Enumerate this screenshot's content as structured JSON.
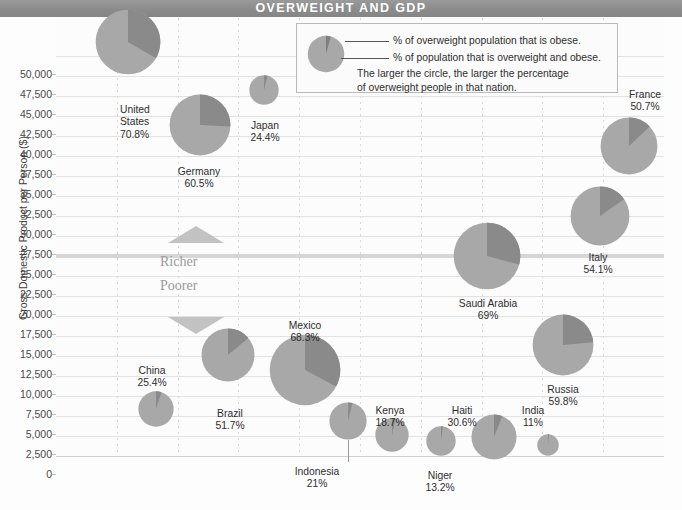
{
  "header": {
    "title": "OVERWEIGHT AND GDP"
  },
  "legend": {
    "line1": "% of overweight population that is obese.",
    "line2": "% of population that is overweight and obese.",
    "line3": "The larger the circle, the larger the percentage",
    "line4": "of overweight people in that nation."
  },
  "axis": {
    "y_title": "Gross Domestic Product per Person ($)",
    "y_ticks": [
      "50,000",
      "47,500",
      "45,000",
      "42,500",
      "40,000",
      "37,500",
      "35,000",
      "32,500",
      "30,000",
      "27,500",
      "25,000",
      "22,500",
      "20,000",
      "17,500",
      "15,000",
      "12,500",
      "10,000",
      "7,500",
      "5,000",
      "2,500",
      "0"
    ]
  },
  "annotations": {
    "richer": "Richer",
    "poorer": "Poorer"
  },
  "colors": {
    "title_bar": "#8e8e8e",
    "pie_light": "#a8a8a8",
    "pie_dark": "#8a8a8a",
    "grid": "#e2e2e2",
    "major_grid": "#c9c9c9",
    "text": "#2d2d2d"
  },
  "chart_data": {
    "type": "scatter",
    "title": "OVERWEIGHT AND GDP",
    "xlabel": "",
    "ylabel": "Gross Domestic Product per Person ($)",
    "ylim": [
      0,
      50000
    ],
    "grid": true,
    "legend_position": "top-center",
    "note": "Bubble size encodes % of population overweight and obese; dark pie wedge encodes % of overweight population that is obese.",
    "series": [
      {
        "name": "United States",
        "overweight_pct": 70.8,
        "gdp_per_person": 50000,
        "label": "United\nStates\n70.8%",
        "cx": 128,
        "cy": 42,
        "r": 33,
        "obese_share_deg": 120,
        "start_deg": 0
      },
      {
        "name": "Germany",
        "overweight_pct": 60.5,
        "gdp_per_person": 41000,
        "label": "Germany\n60.5%",
        "cx": 200,
        "cy": 125,
        "r": 31,
        "obese_share_deg": 93,
        "start_deg": 0
      },
      {
        "name": "Japan",
        "overweight_pct": 24.4,
        "gdp_per_person": 45600,
        "label": "Japan\n24.4%",
        "cx": 264,
        "cy": 90,
        "r": 15,
        "obese_share_deg": 14,
        "start_deg": 0
      },
      {
        "name": "France",
        "overweight_pct": 50.7,
        "gdp_per_person": 39000,
        "label": "France\n50.7%",
        "cx": 629,
        "cy": 146,
        "r": 29,
        "obese_share_deg": 47,
        "start_deg": 0
      },
      {
        "name": "Italy",
        "overweight_pct": 54.1,
        "gdp_per_person": 30500,
        "label": "Italy\n54.1%",
        "cx": 600,
        "cy": 216,
        "r": 30,
        "obese_share_deg": 55,
        "start_deg": 0
      },
      {
        "name": "Saudi Arabia",
        "overweight_pct": 69,
        "gdp_per_person": 25000,
        "label": "Saudi Arabia\n69%",
        "cx": 487,
        "cy": 256,
        "r": 34,
        "obese_share_deg": 105,
        "start_deg": 0
      },
      {
        "name": "Russia",
        "overweight_pct": 59.8,
        "gdp_per_person": 14000,
        "label": "Russia\n59.8%",
        "cx": 563,
        "cy": 345,
        "r": 31,
        "obese_share_deg": 85,
        "start_deg": 0
      },
      {
        "name": "Mexico",
        "overweight_pct": 68.3,
        "gdp_per_person": 10000,
        "label": "Mexico\n68.3%",
        "cx": 305,
        "cy": 370,
        "r": 36,
        "obese_share_deg": 118,
        "start_deg": 0
      },
      {
        "name": "Brazil",
        "overweight_pct": 51.7,
        "gdp_per_person": 11500,
        "label": "Brazil\n51.7%",
        "cx": 228,
        "cy": 355,
        "r": 27,
        "obese_share_deg": 50,
        "start_deg": 0
      },
      {
        "name": "China",
        "overweight_pct": 25.4,
        "gdp_per_person": 6000,
        "label": "China\n25.4%",
        "cx": 156,
        "cy": 409,
        "r": 18,
        "obese_share_deg": 18,
        "start_deg": 0
      },
      {
        "name": "Indonesia",
        "overweight_pct": 21,
        "gdp_per_person": 4500,
        "label": "Indonesia\n21%",
        "cx": 348,
        "cy": 421,
        "r": 19,
        "obese_share_deg": 14,
        "start_deg": 0
      },
      {
        "name": "Kenya",
        "overweight_pct": 18.7,
        "gdp_per_person": 2800,
        "label": "Kenya\n18.7%",
        "cx": 392,
        "cy": 435,
        "r": 17,
        "obese_share_deg": 12,
        "start_deg": 0
      },
      {
        "name": "Niger",
        "overweight_pct": 13.2,
        "gdp_per_person": 2200,
        "label": "Niger\n13.2%",
        "cx": 441,
        "cy": 441,
        "r": 15,
        "obese_share_deg": 8,
        "start_deg": 0
      },
      {
        "name": "Haiti",
        "overweight_pct": 30.6,
        "gdp_per_person": 2600,
        "label": "Haiti\n30.6%",
        "cx": 494,
        "cy": 437,
        "r": 23,
        "obese_share_deg": 22,
        "start_deg": 0
      },
      {
        "name": "India",
        "overweight_pct": 11,
        "gdp_per_person": 2200,
        "label": "India\n11%",
        "cx": 548,
        "cy": 445,
        "r": 11,
        "obese_share_deg": 6,
        "start_deg": 0
      }
    ]
  }
}
